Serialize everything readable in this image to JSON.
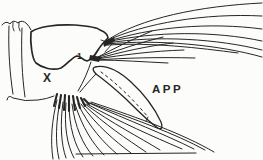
{
  "figure": {
    "background_color": "#fcfcfa",
    "ink_color": "#262626",
    "labels": {
      "segment": "X",
      "appendage": "APP",
      "saddle_seta": "1"
    }
  }
}
